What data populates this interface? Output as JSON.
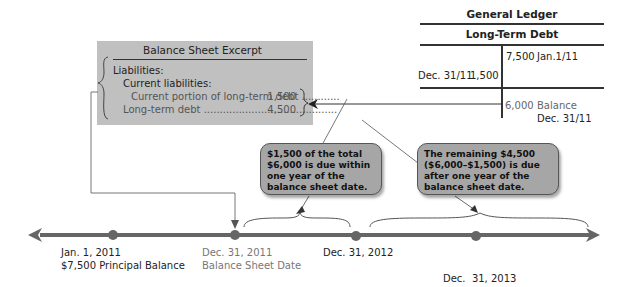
{
  "balance_sheet": {
    "title": "Balance Sheet Excerpt",
    "liabilities_label": "Liabilities:",
    "current_liabilities_label": "Current liabilities:",
    "rows": [
      {
        "label": "Current portion of long-term debt ............",
        "amount": "1,500"
      },
      {
        "label": "Long-term debt ..........................................",
        "amount": "4,500"
      }
    ]
  },
  "general_ledger": {
    "title": "General Ledger",
    "account": "Long-Term Debt",
    "credit_entry": {
      "amount": "7,500",
      "date": "Jan.1/11"
    },
    "debit_entry": {
      "date": "Dec. 31/11",
      "amount": "1,500"
    },
    "balance": {
      "amount": "6,000",
      "label": "Balance",
      "date": "Dec. 31/11"
    }
  },
  "callouts": [
    {
      "text": "$1,500 of the total $6,000 is due within one year of the balance sheet date."
    },
    {
      "text": "The remaining $4,500 ($6,000–$1,500) is due after one year of the balance sheet date."
    }
  ],
  "timeline": {
    "points": [
      {
        "date": "Jan. 1, 2011",
        "sub": "$7,500 Principal Balance"
      },
      {
        "date": "Dec. 31, 2011",
        "sub": "Balance Sheet Date"
      },
      {
        "date": "Dec. 31, 2012",
        "sub": ""
      },
      {
        "date": "Dec.  31, 2013",
        "sub": ""
      }
    ]
  },
  "colors": {
    "box_fill": "#c0c0c0",
    "callout_fill": "#a6a6a6",
    "timeline": "#666666"
  }
}
